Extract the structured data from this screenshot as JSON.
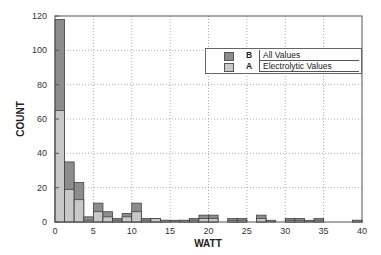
{
  "chart_data": {
    "type": "bar",
    "stacked": true,
    "title": "",
    "xlabel": "WATT",
    "ylabel": "COUNT",
    "xlim": [
      0,
      40
    ],
    "ylim": [
      0,
      120
    ],
    "x_ticks": [
      "0",
      "5",
      "10",
      "15",
      "20",
      "25",
      "30",
      "35",
      "40"
    ],
    "y_ticks": [
      "0",
      "20",
      "40",
      "60",
      "80",
      "100",
      "120"
    ],
    "grid": true,
    "bin_width": 1.25,
    "bin_starts": [
      0,
      1.25,
      2.5,
      3.75,
      5,
      6.25,
      7.5,
      8.75,
      10,
      11.25,
      12.5,
      13.75,
      15,
      16.25,
      17.5,
      18.75,
      20,
      21.25,
      22.5,
      23.75,
      25,
      26.25,
      27.5,
      28.75,
      30,
      31.25,
      32.5,
      33.75,
      35,
      36.25,
      37.5,
      38.75
    ],
    "series": [
      {
        "name": "All Values",
        "code": "B",
        "color": "#8c8c8c",
        "values": [
          118,
          35,
          23,
          3,
          11,
          6,
          2,
          5,
          11,
          2,
          2,
          1,
          1,
          1,
          2,
          4,
          4,
          0,
          2,
          2,
          0,
          4,
          1,
          0,
          2,
          2,
          1,
          2,
          0,
          0,
          0,
          1
        ]
      },
      {
        "name": "Electrolytic Values",
        "code": "A",
        "color": "#c8c8c8",
        "values": [
          65,
          19,
          13,
          1,
          6,
          3,
          1,
          3,
          6,
          1,
          2,
          1,
          0,
          1,
          1,
          2,
          2,
          0,
          1,
          1,
          0,
          2,
          0,
          0,
          1,
          1,
          0,
          1,
          0,
          0,
          0,
          1
        ]
      }
    ],
    "legend_position": "upper right"
  },
  "legend": {
    "items": [
      {
        "code": "B",
        "label": "All Values"
      },
      {
        "code": "A",
        "label": "Electrolytic Values"
      }
    ]
  }
}
